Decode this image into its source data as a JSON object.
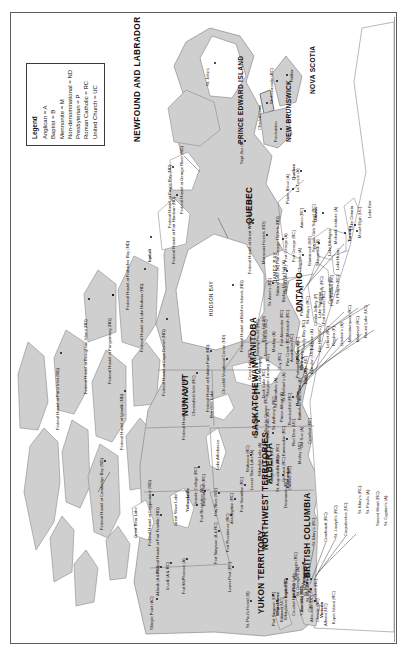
{
  "document": {
    "type": "map",
    "title": "Canada — Residential Schools and Federal Hostels",
    "orientation_note": "landscape map rotated 90 degrees counter-clockwise on a portrait page"
  },
  "legend": {
    "title": "Legend",
    "entries": [
      "Anglican = A",
      "Baptist = B",
      "Mennonite = M",
      "Non-denominational = ND",
      "Presbyterian = P",
      "Roman Catholic = RC",
      "United Church = UC"
    ]
  },
  "provinces": [
    {
      "name": "YUKON TERRITORY"
    },
    {
      "name": "NORTHWEST TERRITORIES"
    },
    {
      "name": "NUNAVUT"
    },
    {
      "name": "BRITISH COLUMBIA"
    },
    {
      "name": "ALBERTA"
    },
    {
      "name": "SASKATCHEWAN"
    },
    {
      "name": "MANITOBA"
    },
    {
      "name": "ONTARIO"
    },
    {
      "name": "QUEBEC"
    },
    {
      "name": "NEWFOUND AND LABRADOR"
    },
    {
      "name": "NEW BRUNSWICK"
    },
    {
      "name": "PRINCE EDWARD ISLAND"
    },
    {
      "name": "NOVA SCOTIA"
    }
  ],
  "water_bodies": [
    {
      "name": "HUDSON BAY"
    },
    {
      "name": "JAMES BAY"
    },
    {
      "name": "Lake Superior"
    },
    {
      "name": "Lake Huron"
    },
    {
      "name": "Lake Michigan"
    },
    {
      "name": "Lake Ontario"
    },
    {
      "name": "Lake Erie"
    },
    {
      "name": "Lake Winnipeg"
    },
    {
      "name": "Lake Athabasca"
    },
    {
      "name": "Great Slave Lake"
    },
    {
      "name": "Great Bear Lake"
    },
    {
      "name": "Reindeer Lake"
    }
  ],
  "cities": [
    {
      "name": "Whitehorse"
    },
    {
      "name": "Yellowknife"
    },
    {
      "name": "Iqaluit"
    },
    {
      "name": "Vancouver"
    },
    {
      "name": "Victoria"
    },
    {
      "name": "Edmonton"
    },
    {
      "name": "Regina"
    },
    {
      "name": "Winnipeg"
    },
    {
      "name": "Toronto"
    },
    {
      "name": "Ottawa"
    },
    {
      "name": "Quebec"
    },
    {
      "name": "Fredericton"
    },
    {
      "name": "Charlottetown"
    },
    {
      "name": "Halifax"
    },
    {
      "name": "St. John's"
    }
  ],
  "sites": {
    "yukon": [
      "Shingle Point (AC)",
      "St. Paul's Hostel (B)",
      "Whitehorse Baptist (B)",
      "Coudert Hall (RC)",
      "Yukon Hall (UC)",
      "Carcross (A)"
    ],
    "northwest_territories": [
      "Aklavik (A & RC)",
      "Inuvik (A & RC)",
      "Fort McPherson (A)",
      "Federal Hostel at Fort Franklin (ND)",
      "Fort Simpson (A & RC)",
      "Fort Providence (RC)",
      "Lower Post (RC)",
      "Fort Resolution (RC)",
      "Hay River (ND)"
    ],
    "nunavut": [
      "Federal Hostel at Pond Inlet (ND)",
      "Federal Hostel at Broughton Island (ND)",
      "Federal Hostel at Pangnirtung (ND)",
      "Federal Hostel at Lake Harbour (ND)",
      "Federal Hostel at Cape Dorset (ND)",
      "Federal Hostel at Frobisher Bay (ND)",
      "Federal Hostel at Igloolik (ND)",
      "Federal Hostel at Cambridge Bay (ND)",
      "Federal Hostel at Coppermine (ND)",
      "Federal Hostel at Eskimo Point (ND)",
      "Federal Hostel at Baker Lake (ND)",
      "Chesterfield Inlet (RC)",
      "Grandin College (RC)",
      "Breynat Hall (RC)",
      "Federal Hostel at Belcher Islands (ND)"
    ],
    "british_columbia": [
      "Port Simpson (UC)",
      "Kitimaat (UC)",
      "Lejac (RC)",
      "Anaham Lake",
      "Doreatky (ND)",
      "St. Michael's (A)",
      "Ahousaht (UC)",
      "Christie (RC)",
      "Sechelt (RC)",
      "St. George's (A)",
      "St. Paul's (RC)",
      "Alberni (UC)",
      "Kuper Island (RC)",
      "St. Mary's (RC)",
      "Cranbrook (RC)",
      "St. Joseph's (RC)",
      "Coqualeetza (UC)",
      "Kamloops (RC)"
    ],
    "alberta": [
      "Assumption (RC)",
      "Fort Vermilion (RC)",
      "Lesser Slave Lake (A)",
      "Wabasca (RC)",
      "Whitefish Lake (A)",
      "Joussard (RC)",
      "Sturgeon Lake (RC)",
      "St. Augustine's (RC)",
      "Grouard (RC)",
      "St. Albert (RC)",
      "Cariboo (RC)",
      "Desmarais (RC)",
      "Ermineskin (RC)",
      "Red Deer (UC)",
      "Old Sun (A)",
      "Morley (UC)",
      "Crowfoot (RC)",
      "St. Mary's (RC)",
      "St. Paul's (A)",
      "Sacred Heart (RC)",
      "St. Cyprian's (A)",
      "Blue Quills (RC)"
    ],
    "saskatchewan": [
      "Beauval (RC)",
      "Ile-a-la-Crosse (RC)",
      "Lac La Ronge (A)",
      "St. Anthony's (RC)",
      "Sturgeon Landing (RC)",
      "St. Barnabas (A)",
      "St. Michael's (A)",
      "Prince Albert (A)",
      "Thunderchild (RC)",
      "Duck Lake (RC)",
      "Gordon's (A)",
      "Marieval (RC)",
      "Muscowequan (RC)",
      "Round Lake (UC)",
      "Regina (P)",
      "File Hills (UC)",
      "Lebret (RC)",
      "Battleford Industrial (A)",
      "Cote (UC)"
    ],
    "manitoba": [
      "Churchill Vocational Centre (ND)",
      "Cross Lake (RC)",
      "Norway House (RC)",
      "Norway House (UC)",
      "Mackay (A)",
      "Poplar Hill (M)",
      "Fort Alexander (RC)",
      "McIntosh (RC)",
      "Guy (RC)",
      "Pine Creek (RC)",
      "Sandy Bay (RC)",
      "Elkhorn (A)",
      "Dauphin (A)",
      "Brandon (UC)",
      "Assiniboia (UC)",
      "Portage la Prairie (UC)",
      "Birtle (P)",
      "Fort Pelly (RC)",
      "Crowstand (P)",
      "St. Philip's (RC)"
    ],
    "ontario": [
      "St. Anne's (RC)",
      "Bishop Horden Hall (A)",
      "Stirland Lake (M)",
      "Cristal Lake (M)",
      "Pelican Lake (A)",
      "St. Mary's (RC)",
      "Cecilia Jeffrey (P)",
      "Fort Frances (RC)",
      "Fort William (RC)",
      "Chapleau (A)",
      "Wawanosh (ND)",
      "Shingwauk (A)",
      "Spanish Girls School (RC)",
      "Mount Elgin (UC)",
      "Mohawk Institute (A)"
    ],
    "quebec": [
      "Federal Hostel at Fort Harrison (ND)",
      "Federal Hostel at Payne Bay (ND)",
      "Federal Hostel at George River (ND)",
      "Federal Hostel at Great Whale River (ND)",
      "Fort George Hostels (ND)",
      "Fort George (A)",
      "Fort George (RC)",
      "Sept-Iles (RC)",
      "Amos (RC)",
      "Pointe Bleue (A)",
      "La Tuque (A)",
      "Mistassini Hostels (ND)"
    ],
    "atlantic": [
      "Shubenacadie (RC)"
    ]
  }
}
